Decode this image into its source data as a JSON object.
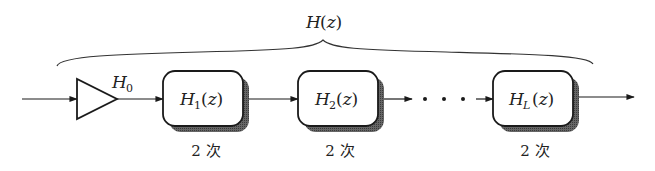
{
  "diagram": {
    "type": "cascade-block-diagram",
    "overall": {
      "label_main": "H",
      "label_arg": "(z)",
      "full_label": "H(z)"
    },
    "gain": {
      "label_main": "H",
      "label_sub": "0",
      "full_label": "H0"
    },
    "blocks": [
      {
        "label_main": "H",
        "label_sub": "1",
        "label_arg": "(z)",
        "full_label": "H1(z)",
        "order_label": "2 次"
      },
      {
        "label_main": "H",
        "label_sub": "2",
        "label_arg": "(z)",
        "full_label": "H2(z)",
        "order_label": "2 次"
      },
      {
        "label_main": "H",
        "label_sub": "L",
        "label_arg": "(z)",
        "full_label": "HL(z)",
        "order_label": "2 次"
      }
    ],
    "ellipsis": "· · ·",
    "colors": {
      "stroke": "#1a1a1a",
      "shadow": "#555555",
      "box_fill": "#ffffff",
      "background": "#ffffff"
    }
  }
}
